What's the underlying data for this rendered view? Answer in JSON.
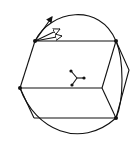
{
  "diagram": {
    "background": "#ffffff",
    "stroke": "#111111",
    "vertices": [
      {
        "id": "top-left",
        "x": 35,
        "y": 41
      },
      {
        "id": "top-right",
        "x": 116,
        "y": 41
      },
      {
        "id": "mid-left",
        "x": 20,
        "y": 88
      },
      {
        "id": "mid-right",
        "x": 102,
        "y": 88
      },
      {
        "id": "bottom-right",
        "x": 116,
        "y": 118
      }
    ],
    "center_node": {
      "x": 77,
      "y": 78,
      "branches": [
        [
          71,
          71
        ],
        [
          84,
          78
        ],
        [
          72,
          85
        ]
      ]
    },
    "arrows_from": "top-left",
    "arrow_count": 3
  }
}
